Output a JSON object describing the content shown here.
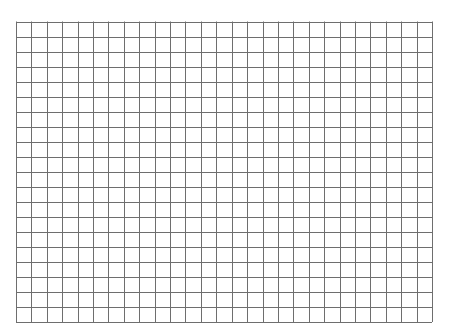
{
  "sheet": {
    "type": "blank-grid-paper",
    "background_color": "#ffffff",
    "line_color": "#6e6e6e",
    "line_width": 1,
    "grid": {
      "left": 16,
      "top": 21.5,
      "right": 432,
      "bottom": 322,
      "columns": 27,
      "rows": 20
    }
  }
}
